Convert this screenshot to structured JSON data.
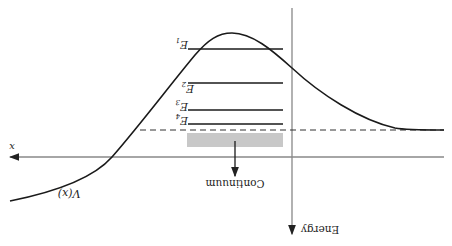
{
  "figure": {
    "orientation": "rotated-180",
    "labels": {
      "x_axis": "x",
      "energy_axis": "Energy",
      "potential": "V(x)",
      "continuum": "Continuum"
    },
    "energy_levels": [
      {
        "name": "E",
        "sub": "1"
      },
      {
        "name": "E",
        "sub": "2"
      },
      {
        "name": "E",
        "sub": "3"
      },
      {
        "name": "E",
        "sub": "4"
      }
    ],
    "colors": {
      "line": "#1a1a1a",
      "axis": "#888888",
      "continuum_band": "#c8c8c8",
      "dashed": "#333333"
    }
  }
}
